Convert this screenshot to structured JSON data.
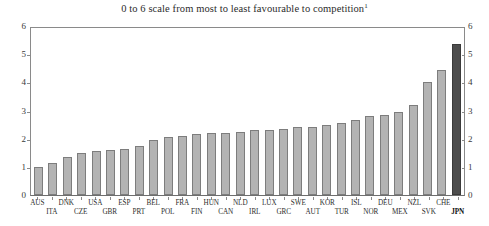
{
  "chart_data": {
    "type": "bar",
    "title": "0 to 6 scale from most to least favourable to competition",
    "title_footnote_marker": "1",
    "xlabel": "",
    "ylabel": "",
    "ylim": [
      0,
      6
    ],
    "yticks": [
      0,
      1,
      2,
      3,
      4,
      5,
      6
    ],
    "ytick_labels": [
      "0",
      "1",
      "2",
      "3",
      "4",
      "5",
      "6"
    ],
    "right_axis_ticks": [
      0,
      1,
      2,
      3,
      4,
      5,
      6
    ],
    "right_axis_tick_labels": [
      "0",
      "1",
      "2",
      "3",
      "4",
      "5",
      "6"
    ],
    "grid": false,
    "legend": "none",
    "categories": [
      "AUS",
      "ITA",
      "DNK",
      "CZE",
      "USA",
      "GBR",
      "ESP",
      "PRT",
      "BEL",
      "POL",
      "FRA",
      "FIN",
      "HUN",
      "CAN",
      "NLD",
      "IRL",
      "LUX",
      "GRC",
      "SWE",
      "AUT",
      "KOR",
      "TUR",
      "ISL",
      "NOR",
      "DEU",
      "MEX",
      "NZL",
      "SVK",
      "CHE",
      "JPN"
    ],
    "values": [
      1.0,
      1.15,
      1.35,
      1.5,
      1.55,
      1.6,
      1.65,
      1.75,
      1.95,
      2.05,
      2.1,
      2.15,
      2.2,
      2.2,
      2.25,
      2.3,
      2.3,
      2.35,
      2.4,
      2.4,
      2.5,
      2.55,
      2.65,
      2.8,
      2.85,
      2.95,
      3.2,
      4.0,
      4.45,
      5.35
    ],
    "highlight_category": "JPN",
    "colors": {
      "bar": "#b3b3b3",
      "bar_border": "#7d7d7d",
      "highlight_bar": "#4d4d4d",
      "highlight_bar_border": "#3a3a3a",
      "axis": "#8a8a8a",
      "text": "#2e2e2e"
    }
  }
}
